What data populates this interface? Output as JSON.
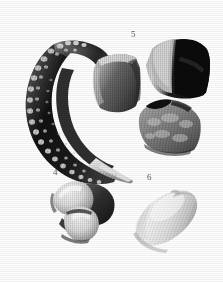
{
  "plate": {
    "kind": "fossil-specimen-plate",
    "background_color": "#ffffff",
    "width": 223,
    "height": 282,
    "label_color": "#58585a",
    "palette": {
      "darkest": "#0d0d0d",
      "dark": "#2b2b2b",
      "mid_dark": "#555555",
      "mid": "#7d7d7d",
      "light_mid": "#a9a9a9",
      "light": "#cfcfcf",
      "highlight": "#efefef",
      "white": "#ffffff"
    },
    "labels": [
      {
        "text": "5",
        "x": 131,
        "y": 30
      },
      {
        "text": "4",
        "x": 53,
        "y": 168
      },
      {
        "text": "6",
        "x": 147,
        "y": 173
      }
    ],
    "specimens": [
      {
        "id": "large-curved-element",
        "name": "large curved denticulate element",
        "label": "",
        "description": "crescent-shaped hook-like fossil element, dark with a nodular granular convex outer margin and a pale pointed distal tip",
        "bbox": {
          "x": 22,
          "y": 36,
          "width": 112,
          "height": 146
        }
      },
      {
        "id": "fragment-left",
        "name": "specimen 5 left fragment",
        "label": "5",
        "description": "quadrate fragment, pale left edge grading to medium grey with fine vertical striations",
        "bbox": {
          "x": 90,
          "y": 52,
          "width": 52,
          "height": 63
        }
      },
      {
        "id": "fragment-upper-right",
        "name": "specimen 5 upper right fragment",
        "label": "5",
        "description": "blocky fragment with a bright pale left band and a near-black right half",
        "bbox": {
          "x": 140,
          "y": 39,
          "width": 70,
          "height": 62
        }
      },
      {
        "id": "fragment-lower-right",
        "name": "specimen 5 lower right fragment",
        "label": "5",
        "description": "rounded-trapezoidal fragment, mottled medium grey with a dark notch on the upper margin",
        "bbox": {
          "x": 133,
          "y": 98,
          "width": 68,
          "height": 60
        }
      },
      {
        "id": "bilobate-element",
        "name": "specimen 4 bilobate element",
        "label": "4",
        "description": "two pale bulbous tooth-like lobes set against darker basal tissue",
        "bbox": {
          "x": 48,
          "y": 177,
          "width": 68,
          "height": 63
        }
      },
      {
        "id": "ovate-element",
        "name": "specimen 6 ovate element",
        "label": "6",
        "description": "smooth pale ellipsoidal body, obliquely oriented, faint longitudinal fibrous texture",
        "bbox": {
          "x": 128,
          "y": 182,
          "width": 74,
          "height": 70
        }
      }
    ]
  }
}
